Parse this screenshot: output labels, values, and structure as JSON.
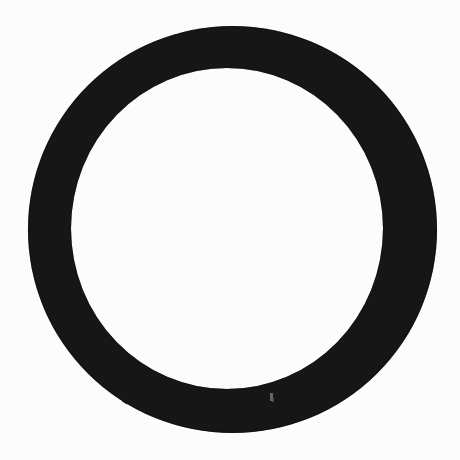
{
  "document": {
    "title": "Black Ring",
    "kind": "scanned-figure",
    "caption": "",
    "page_width": 460,
    "page_height": 460
  },
  "canvas": {
    "width": 460,
    "height": 460,
    "background_color": "#fdfdfd",
    "paper_tone": "#ffffff"
  },
  "figure": {
    "name": "black-ring",
    "shape": "annulus",
    "fill_color": "#141414",
    "edge_color": "#1a1a1a",
    "interior_color": "#fefefe",
    "outer_circle": {
      "center_x": 232.5,
      "center_y": 229.5,
      "radius_x": 204.5,
      "radius_y": 203.5,
      "diameter": 408,
      "left": 28,
      "right": 437,
      "top": 26,
      "bottom": 433
    },
    "inner_circle": {
      "center_x": 227.0,
      "center_y": 228.5,
      "radius_x": 156.0,
      "radius_y": 160.5,
      "diameter": 316,
      "left": 71,
      "right": 383,
      "top": 68,
      "bottom": 389
    },
    "stroke_width_px": 46,
    "stroke_width_top_px": 42,
    "stroke_width_left_px": 43,
    "stroke_width_right_px": 54,
    "stroke_width_bottom_px": 44
  },
  "artifacts": [
    {
      "name": "scan-speck-bottom",
      "type": "light-speck",
      "x": 270,
      "y": 393,
      "width": 3,
      "height": 8,
      "color": "#6e6e6e"
    },
    {
      "name": "scan-speck-bottom-2",
      "type": "light-speck",
      "x": 272,
      "y": 398,
      "width": 2,
      "height": 4,
      "color": "#585858"
    }
  ],
  "chart_data": {
    "type": "pie",
    "title": "",
    "subtitle": "",
    "xlabel": "",
    "ylabel": "",
    "categories": [
      "ring"
    ],
    "values": [
      100
    ],
    "series": [
      {
        "name": "ring",
        "values": [
          100
        ]
      }
    ],
    "colors": [
      "#141414"
    ],
    "legend": [],
    "annotations": [],
    "donut": true,
    "donut_hole_ratio": 0.77,
    "grid": false,
    "legend_position": "none"
  }
}
